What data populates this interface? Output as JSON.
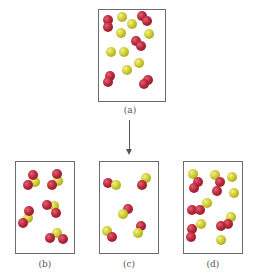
{
  "figure": {
    "arrow_direction": "down",
    "colors": {
      "red_atom": "#b8283c",
      "yellow_atom": "#c8c62a",
      "frame": "#6b6b6b",
      "label": "#555555"
    },
    "panels": [
      {
        "id": "a",
        "label": "(a)",
        "box": {
          "x": 98,
          "y": 9,
          "w": 68,
          "h": 93
        },
        "label_pos": {
          "x": 110,
          "y": 105
        },
        "atoms": [
          {
            "c": "red",
            "x": 108,
            "y": 20
          },
          {
            "c": "red",
            "x": 108,
            "y": 27
          },
          {
            "c": "yellow",
            "x": 122,
            "y": 17
          },
          {
            "c": "red",
            "x": 142,
            "y": 16
          },
          {
            "c": "red",
            "x": 147,
            "y": 21
          },
          {
            "c": "yellow",
            "x": 132,
            "y": 24
          },
          {
            "c": "yellow",
            "x": 121,
            "y": 33
          },
          {
            "c": "yellow",
            "x": 149,
            "y": 34
          },
          {
            "c": "red",
            "x": 136,
            "y": 41
          },
          {
            "c": "red",
            "x": 141,
            "y": 46
          },
          {
            "c": "yellow",
            "x": 111,
            "y": 52
          },
          {
            "c": "yellow",
            "x": 124,
            "y": 52
          },
          {
            "c": "yellow",
            "x": 139,
            "y": 63
          },
          {
            "c": "yellow",
            "x": 127,
            "y": 70
          },
          {
            "c": "red",
            "x": 110,
            "y": 76
          },
          {
            "c": "red",
            "x": 108,
            "y": 82
          },
          {
            "c": "red",
            "x": 148,
            "y": 80
          },
          {
            "c": "red",
            "x": 144,
            "y": 84
          }
        ]
      },
      {
        "id": "b",
        "label": "(b)",
        "box": {
          "x": 15,
          "y": 161,
          "w": 60,
          "h": 93
        },
        "label_pos": {
          "x": 25,
          "y": 259
        },
        "atoms": [
          {
            "c": "yellow",
            "x": 35,
            "y": 182
          },
          {
            "c": "red",
            "x": 33,
            "y": 175
          },
          {
            "c": "red",
            "x": 28,
            "y": 185
          },
          {
            "c": "yellow",
            "x": 58,
            "y": 181
          },
          {
            "c": "red",
            "x": 57,
            "y": 174
          },
          {
            "c": "red",
            "x": 52,
            "y": 185
          },
          {
            "c": "yellow",
            "x": 28,
            "y": 218
          },
          {
            "c": "red",
            "x": 29,
            "y": 211
          },
          {
            "c": "red",
            "x": 23,
            "y": 223
          },
          {
            "c": "yellow",
            "x": 54,
            "y": 206
          },
          {
            "c": "red",
            "x": 47,
            "y": 205
          },
          {
            "c": "red",
            "x": 56,
            "y": 213
          },
          {
            "c": "yellow",
            "x": 57,
            "y": 233
          },
          {
            "c": "red",
            "x": 50,
            "y": 238
          },
          {
            "c": "red",
            "x": 63,
            "y": 239
          }
        ]
      },
      {
        "id": "c",
        "label": "(c)",
        "box": {
          "x": 99,
          "y": 161,
          "w": 60,
          "h": 93
        },
        "label_pos": {
          "x": 109,
          "y": 259
        },
        "atoms": [
          {
            "c": "red",
            "x": 108,
            "y": 183
          },
          {
            "c": "yellow",
            "x": 116,
            "y": 185
          },
          {
            "c": "yellow",
            "x": 146,
            "y": 178
          },
          {
            "c": "red",
            "x": 142,
            "y": 185
          },
          {
            "c": "red",
            "x": 128,
            "y": 209
          },
          {
            "c": "yellow",
            "x": 123,
            "y": 214
          },
          {
            "c": "yellow",
            "x": 107,
            "y": 231
          },
          {
            "c": "red",
            "x": 112,
            "y": 237
          },
          {
            "c": "red",
            "x": 141,
            "y": 226
          },
          {
            "c": "yellow",
            "x": 138,
            "y": 233
          }
        ]
      },
      {
        "id": "d",
        "label": "(d)",
        "box": {
          "x": 183,
          "y": 161,
          "w": 60,
          "h": 93
        },
        "label_pos": {
          "x": 193,
          "y": 259
        },
        "atoms": [
          {
            "c": "yellow",
            "x": 193,
            "y": 174
          },
          {
            "c": "red",
            "x": 198,
            "y": 182
          },
          {
            "c": "red",
            "x": 194,
            "y": 188
          },
          {
            "c": "yellow",
            "x": 215,
            "y": 175
          },
          {
            "c": "red",
            "x": 220,
            "y": 182
          },
          {
            "c": "red",
            "x": 217,
            "y": 191
          },
          {
            "c": "yellow",
            "x": 232,
            "y": 177
          },
          {
            "c": "yellow",
            "x": 234,
            "y": 193
          },
          {
            "c": "yellow",
            "x": 207,
            "y": 203
          },
          {
            "c": "red",
            "x": 192,
            "y": 210
          },
          {
            "c": "red",
            "x": 200,
            "y": 210
          },
          {
            "c": "yellow",
            "x": 201,
            "y": 224
          },
          {
            "c": "red",
            "x": 192,
            "y": 229
          },
          {
            "c": "red",
            "x": 191,
            "y": 237
          },
          {
            "c": "yellow",
            "x": 231,
            "y": 217
          },
          {
            "c": "red",
            "x": 228,
            "y": 224
          },
          {
            "c": "red",
            "x": 221,
            "y": 226
          },
          {
            "c": "yellow",
            "x": 221,
            "y": 240
          }
        ]
      }
    ]
  }
}
